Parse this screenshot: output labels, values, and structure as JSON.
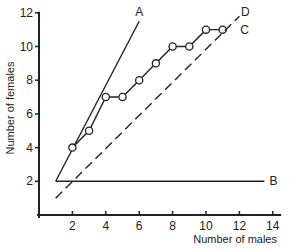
{
  "chart_data": {
    "type": "line",
    "title": "",
    "xlabel": "Number of males",
    "ylabel": "Number of females",
    "xlim": [
      0,
      14.5
    ],
    "ylim": [
      0,
      12
    ],
    "xticks": [
      2,
      4,
      6,
      8,
      10,
      12,
      14
    ],
    "yticks": [
      2,
      4,
      6,
      8,
      10,
      12
    ],
    "grid": false,
    "legend": "inline labels at line ends",
    "series": [
      {
        "name": "A",
        "style": "solid",
        "x": [
          1,
          6
        ],
        "y": [
          2,
          11.5
        ]
      },
      {
        "name": "B",
        "style": "solid",
        "x": [
          1,
          13.5
        ],
        "y": [
          2,
          2
        ]
      },
      {
        "name": "C",
        "style": "solid-with-open-circles",
        "x": [
          2,
          3,
          4,
          5,
          6,
          7,
          8,
          9,
          10,
          11
        ],
        "y": [
          4,
          5,
          7,
          7,
          8,
          9,
          10,
          10,
          11,
          11
        ]
      },
      {
        "name": "D",
        "style": "dashed",
        "x": [
          1,
          12
        ],
        "y": [
          1,
          11.8
        ]
      }
    ]
  }
}
